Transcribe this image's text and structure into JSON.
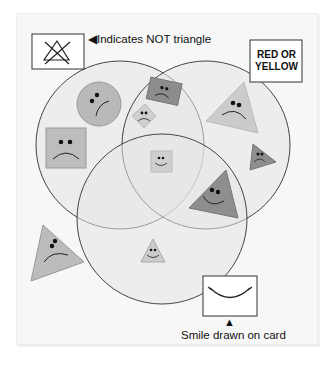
{
  "diagram": {
    "type": "venn",
    "set_count": 3,
    "colors": {
      "background": "#f7f7f7",
      "circle_fill": "#e6e6e6",
      "circle_stroke": "#444444",
      "shape_light": "#c8c8c8",
      "shape_mid": "#b4b4b4",
      "shape_dark": "#8a8a8a",
      "ink": "#111111"
    }
  },
  "legends": {
    "not_triangle": {
      "icon": "crossed-triangle-icon",
      "text": "Indicates NOT triangle",
      "pointer": "◀"
    },
    "red_or_yellow": {
      "line1": "RED OR",
      "line2": "YELLOW"
    },
    "smile": {
      "icon": "smile-curve-icon",
      "text": "Smile drawn on card",
      "pointer": "▲"
    }
  },
  "sets": [
    {
      "id": "not-triangle",
      "label": "NOT triangle",
      "cx": 120,
      "cy": 145,
      "r": 84
    },
    {
      "id": "red-or-yellow",
      "label": "RED OR YELLOW",
      "cx": 206,
      "cy": 145,
      "r": 84
    },
    {
      "id": "smile",
      "label": "Smile drawn on card",
      "cx": 162,
      "cy": 219,
      "r": 85
    }
  ],
  "shapes": [
    {
      "kind": "circle",
      "face": "frown",
      "tone": "mid",
      "region": "not-triangle only"
    },
    {
      "kind": "square",
      "face": "frown",
      "tone": "mid",
      "region": "not-triangle only"
    },
    {
      "kind": "rectangle",
      "face": "frown",
      "tone": "dark",
      "region": "not-triangle and red-or-yellow"
    },
    {
      "kind": "diamond",
      "face": "frown",
      "tone": "light",
      "region": "not-triangle and red-or-yellow"
    },
    {
      "kind": "square",
      "face": "smile",
      "tone": "light",
      "region": "all three"
    },
    {
      "kind": "triangle",
      "face": "frown",
      "tone": "light",
      "region": "red-or-yellow only"
    },
    {
      "kind": "triangle",
      "face": "frown",
      "tone": "dark",
      "region": "red-or-yellow only"
    },
    {
      "kind": "triangle",
      "face": "smile",
      "tone": "dark",
      "region": "red-or-yellow and smile"
    },
    {
      "kind": "triangle",
      "face": "smile",
      "tone": "light",
      "region": "smile only"
    },
    {
      "kind": "triangle",
      "face": "frown",
      "tone": "mid",
      "region": "outside all sets"
    }
  ]
}
